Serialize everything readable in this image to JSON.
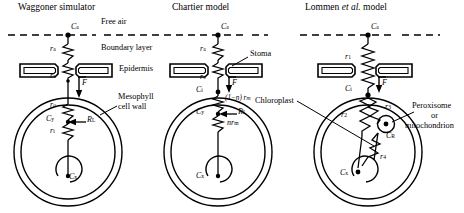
{
  "figure": {
    "kind": "electrical-analog diagram of leaf CO2 diffusion resistance models",
    "width": 464,
    "height": 213,
    "stroke_color": "#000000",
    "background": "#ffffff"
  },
  "panels": [
    {
      "id": "waggoner",
      "title": "Waggoner simulator",
      "nodes": [
        {
          "name": "Ca",
          "base": "C",
          "sub": "a"
        },
        {
          "name": "Cy",
          "base": "C",
          "sub": "y"
        },
        {
          "name": "Cx",
          "base": "C",
          "sub": "x"
        }
      ],
      "resistors": [
        {
          "name": "ra",
          "base": "r",
          "sub": "a"
        },
        {
          "name": "rs",
          "base": "r",
          "sub": "s"
        },
        {
          "name": "ro",
          "base": "r",
          "sub": "o"
        },
        {
          "name": "ri",
          "base": "r",
          "sub": "i"
        }
      ],
      "flux": {
        "name": "F",
        "base": "F",
        "sub": ""
      },
      "source": {
        "name": "RL",
        "base": "R",
        "sub": "L"
      }
    },
    {
      "id": "chartier",
      "title": "Chartier model",
      "nodes": [
        {
          "name": "Ca",
          "base": "C",
          "sub": "a"
        },
        {
          "name": "Ci",
          "base": "C",
          "sub": "i"
        },
        {
          "name": "Cy",
          "base": "C",
          "sub": "y"
        },
        {
          "name": "Cx",
          "base": "C",
          "sub": "x"
        }
      ],
      "resistors": [
        {
          "name": "ra",
          "base": "r",
          "sub": "a"
        },
        {
          "name": "rs",
          "base": "r",
          "sub": "s"
        },
        {
          "name": "(1-n)rm",
          "base": "(1−n) r",
          "sub": "m"
        },
        {
          "name": "nrm",
          "base": "nr",
          "sub": "m"
        }
      ],
      "flux": {
        "name": "F",
        "base": "F",
        "sub": ""
      },
      "source": {
        "name": "RL",
        "base": "R",
        "sub": "L"
      }
    },
    {
      "id": "lommen",
      "title_plain_1": "Lommen ",
      "title_italic": "et al.",
      "title_plain_2": " model",
      "title": "Lommen et al. model",
      "nodes": [
        {
          "name": "Ca",
          "base": "C",
          "sub": "a"
        },
        {
          "name": "Ci",
          "base": "C",
          "sub": "i"
        },
        {
          "name": "CR",
          "base": "C",
          "sub": "R"
        },
        {
          "name": "Cx",
          "base": "C",
          "sub": "x"
        }
      ],
      "resistors": [
        {
          "name": "r1",
          "base": "r",
          "sub": "1"
        },
        {
          "name": "r2",
          "base": "r",
          "sub": "2"
        },
        {
          "name": "r3",
          "base": "r",
          "sub": "3"
        },
        {
          "name": "r4",
          "base": "r",
          "sub": "4"
        }
      ],
      "flux": {
        "name": "F",
        "base": "F",
        "sub": ""
      }
    }
  ],
  "annotations": {
    "free_air": "Free air",
    "boundary_layer": "Boundary layer",
    "epidermis": "Epidermis",
    "mesophyll_line1": "Mesophyll",
    "mesophyll_line2": "cell wall",
    "stoma": "Stoma",
    "chloroplast": "Chloroplast",
    "peroxisome_line1": "Peroxisome",
    "peroxisome_line2": "or",
    "peroxisome_line3": "mitochondrion"
  }
}
